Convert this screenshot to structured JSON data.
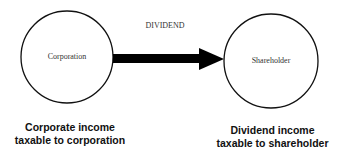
{
  "diagram": {
    "nodes": [
      {
        "id": "corporation",
        "label": "Corporation",
        "caption_line1": "Corporate income",
        "caption_line2": "taxable to corporation"
      },
      {
        "id": "shareholder",
        "label": "Shareholder",
        "caption_line1": "Dividend income",
        "caption_line2": "taxable to shareholder"
      }
    ],
    "edge": {
      "from": "corporation",
      "to": "shareholder",
      "label": "DIVIDEND"
    },
    "colors": {
      "stroke": "#111111",
      "background": "#ffffff"
    }
  }
}
